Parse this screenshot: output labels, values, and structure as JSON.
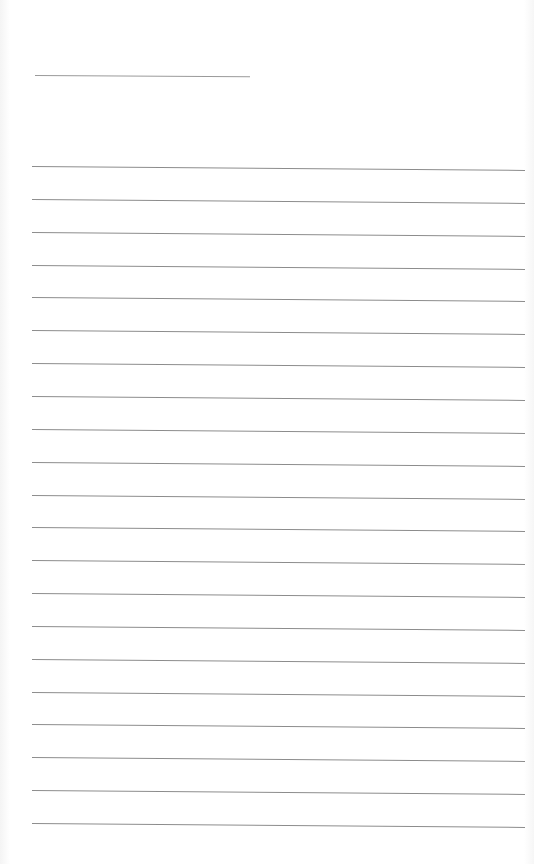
{
  "page": {
    "type": "lined-notepaper",
    "background_color": "#ffffff",
    "line_color": "#8c8c8c"
  },
  "title_line": {
    "left": 35,
    "top": 75,
    "width": 215
  },
  "rules": {
    "count": 21,
    "first_top": 166,
    "spacing": 32.85,
    "left": 32,
    "width": 493
  }
}
